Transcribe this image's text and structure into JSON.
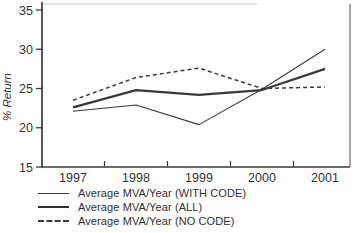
{
  "chart_data": {
    "type": "line",
    "title": "",
    "xlabel": "",
    "ylabel": "% Return",
    "categories": [
      "1997",
      "1998",
      "1999",
      "2000",
      "2001"
    ],
    "yticks": [
      35,
      30,
      25,
      20,
      15
    ],
    "ylim": [
      15,
      35
    ],
    "grid": false,
    "legend_position": "bottom-left",
    "line_color": "#3a3a3a",
    "series": [
      {
        "name": "Average MVA/Year (WITH CODE)",
        "line_style": "solid-thin",
        "values": [
          22.1,
          22.9,
          20.4,
          24.9,
          30.0
        ]
      },
      {
        "name": "Average MVA/Year (ALL)",
        "line_style": "solid-thick",
        "values": [
          22.6,
          24.8,
          24.2,
          24.8,
          27.5
        ]
      },
      {
        "name": "Average MVA/Year (NO CODE)",
        "line_style": "dashed",
        "values": [
          23.5,
          26.4,
          27.6,
          25.0,
          25.2
        ]
      }
    ]
  }
}
